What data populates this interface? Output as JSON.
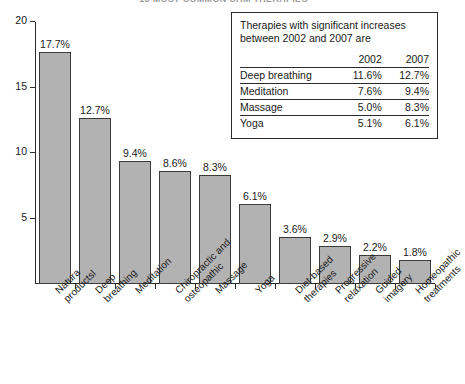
{
  "chart_data": {
    "type": "bar",
    "title": "10 MOST COMMON CAM THERAPIES",
    "xlabel": "",
    "ylabel": "",
    "ylim": [
      0,
      20
    ],
    "yticks": [
      "5",
      "10",
      "15",
      "20"
    ],
    "ytick_values": [
      5,
      10,
      15,
      20
    ],
    "grid": false,
    "legend_position": "top-right",
    "categories": [
      "Natura productsl",
      "Deep breathing",
      "Meditation",
      "Chiropractic and osteopathic",
      "Massage",
      "Yoga",
      "Diet-based therapies",
      "Progressive relaxation",
      "Guided imagery",
      "Homeopathic treatments"
    ],
    "category_lines": [
      [
        "Natura",
        "productsl"
      ],
      [
        "Deep",
        "breathing"
      ],
      [
        "Meditation"
      ],
      [
        "Chiropractic and",
        "osteopathic"
      ],
      [
        "Massage"
      ],
      [
        "Yoga"
      ],
      [
        "Diet-based",
        "therapies"
      ],
      [
        "Progressive",
        "relaxation"
      ],
      [
        "Guided",
        "imagery"
      ],
      [
        "Homeopathic",
        "treatments"
      ]
    ],
    "values": [
      17.7,
      12.7,
      9.4,
      8.6,
      8.3,
      6.1,
      3.6,
      2.9,
      2.2,
      1.8
    ],
    "data_labels": [
      "17.7%",
      "12.7%",
      "9.4%",
      "8.6%",
      "8.3%",
      "6.1%",
      "3.6%",
      "2.9%",
      "2.2%",
      "1.8%"
    ],
    "bar_color": "#b2b2b2",
    "bar_border_color": "#3a3a3a"
  },
  "legend": {
    "heading": "Therapies with significant increases between 2002 and 2007 are",
    "columns": [
      "",
      "2002",
      "2007"
    ],
    "rows": [
      {
        "therapy": "Deep breathing",
        "y2002": "11.6%",
        "y2007": "12.7%"
      },
      {
        "therapy": "Meditation",
        "y2002": "7.6%",
        "y2007": "9.4%"
      },
      {
        "therapy": "Massage",
        "y2002": "5.0%",
        "y2007": "8.3%"
      },
      {
        "therapy": "Yoga",
        "y2002": "5.1%",
        "y2007": "6.1%"
      }
    ]
  }
}
